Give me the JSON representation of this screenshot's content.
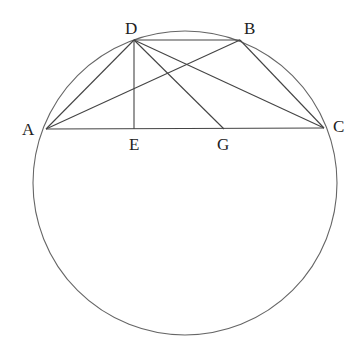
{
  "diagram": {
    "type": "geometry",
    "circle": {
      "cx": 185,
      "cy": 183,
      "r": 152
    },
    "points": {
      "A": {
        "x": 46,
        "y": 129
      },
      "B": {
        "x": 240,
        "y": 40
      },
      "C": {
        "x": 324,
        "y": 128
      },
      "D": {
        "x": 134,
        "y": 40
      },
      "E": {
        "x": 134,
        "y": 129
      },
      "G": {
        "x": 224,
        "y": 129
      }
    },
    "segments": [
      [
        "A",
        "C"
      ],
      [
        "D",
        "B"
      ],
      [
        "A",
        "D"
      ],
      [
        "A",
        "B"
      ],
      [
        "D",
        "E"
      ],
      [
        "D",
        "G"
      ],
      [
        "D",
        "C"
      ],
      [
        "B",
        "C"
      ]
    ],
    "labels": {
      "A": "A",
      "B": "B",
      "C": "C",
      "D": "D",
      "E": "E",
      "G": "G"
    }
  }
}
